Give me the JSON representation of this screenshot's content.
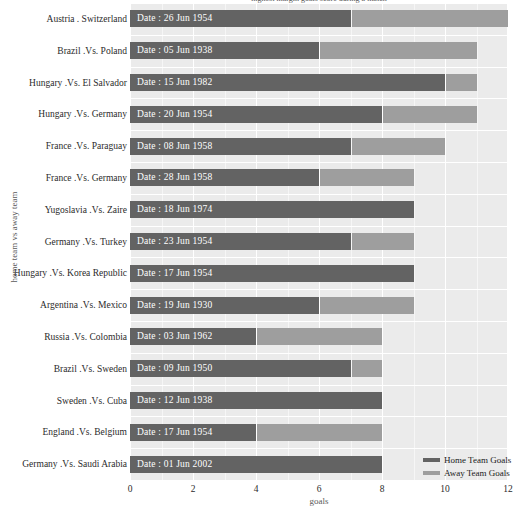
{
  "chart_data": {
    "type": "bar",
    "subtype": "stacked-horizontal",
    "title": "highest margin goals score during a match",
    "xlabel": "goals",
    "ylabel": "home team vs away team",
    "xlim": [
      0,
      12
    ],
    "xticks": [
      0,
      2,
      4,
      6,
      8,
      10,
      12
    ],
    "xticklabels": [
      "0",
      "2",
      "4",
      "6",
      "8",
      "10",
      "12"
    ],
    "grid": true,
    "legend": {
      "position": "bottom-right",
      "entries": [
        {
          "name": "Home Team Goals",
          "color": "#636363"
        },
        {
          "name": "Away Team Goals",
          "color": "#9e9e9e"
        }
      ]
    },
    "categories": [
      "Austria . Switzerland",
      "Brazil .Vs. Poland",
      "Hungary .Vs. El Salvador",
      "Hungary .Vs. Germany",
      "France .Vs. Paraguay",
      "France .Vs. Germany",
      "Yugoslavia .Vs. Zaire",
      "Germany .Vs. Turkey",
      "Hungary .Vs. Korea Republic",
      "Argentina .Vs. Mexico",
      "Russia .Vs. Colombia",
      "Brazil .Vs. Sweden",
      "Sweden .Vs. Cuba",
      "England .Vs. Belgium",
      "Germany .Vs. Saudi Arabia"
    ],
    "bar_labels": [
      "Date : 26 Jun 1954",
      "Date : 05 Jun 1938",
      "Date : 15 Jun 1982",
      "Date : 20 Jun 1954",
      "Date : 08 Jun 1958",
      "Date : 28 Jun 1958",
      "Date : 18 Jun 1974",
      "Date : 23 Jun 1954",
      "Date : 17 Jun 1954",
      "Date : 19 Jun 1930",
      "Date : 03 Jun 1962",
      "Date : 09 Jun 1950",
      "Date : 12 Jun 1938",
      "Date : 17 Jun 1954",
      "Date : 01 Jun 2002"
    ],
    "series": [
      {
        "name": "Home Team Goals",
        "color": "#636363",
        "values": [
          7,
          6,
          10,
          8,
          7,
          6,
          9,
          7,
          9,
          6,
          4,
          7,
          8,
          4,
          8
        ]
      },
      {
        "name": "Away Team Goals",
        "color": "#9e9e9e",
        "values": [
          5,
          5,
          1,
          3,
          3,
          3,
          0,
          2,
          0,
          3,
          4,
          1,
          0,
          4,
          0
        ]
      }
    ],
    "totals": [
      12,
      11,
      11,
      11,
      10,
      9,
      9,
      9,
      9,
      9,
      8,
      8,
      8,
      8,
      8
    ],
    "colors": {
      "panel_background": "#ebebeb",
      "grid_major": "#ffffff",
      "grid_minor": "#f6f6f6",
      "home": "#636363",
      "away": "#9e9e9e",
      "text": "#2b2b2b",
      "axis_label": "#5a5a5a"
    }
  }
}
